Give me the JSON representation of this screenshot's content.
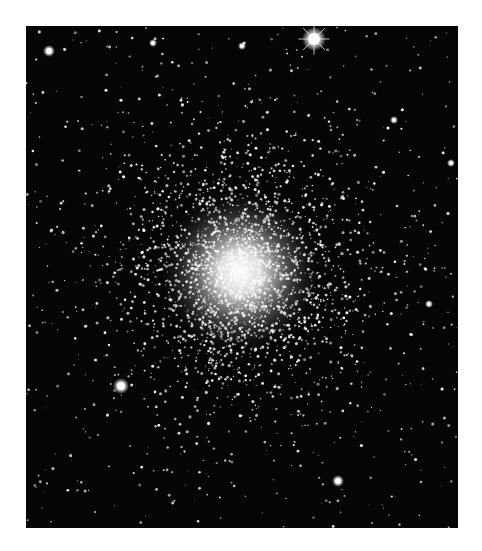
{
  "image": {
    "subject": "globular star cluster",
    "background_color": "#050505",
    "page_background": "#ffffff",
    "frame": {
      "x": 26,
      "y": 26,
      "width": 432,
      "height": 502
    },
    "core_center": {
      "x": 214,
      "y": 246
    },
    "bright_stars": [
      {
        "x": 288,
        "y": 13,
        "r": 6,
        "spike": true
      },
      {
        "x": 23,
        "y": 25,
        "r": 3
      },
      {
        "x": 95,
        "y": 360,
        "r": 4
      },
      {
        "x": 312,
        "y": 455,
        "r": 3
      },
      {
        "x": 127,
        "y": 17,
        "r": 2
      },
      {
        "x": 368,
        "y": 94,
        "r": 2
      },
      {
        "x": 425,
        "y": 137,
        "r": 2
      },
      {
        "x": 403,
        "y": 278,
        "r": 2
      },
      {
        "x": 216,
        "y": 20,
        "r": 2
      }
    ]
  }
}
